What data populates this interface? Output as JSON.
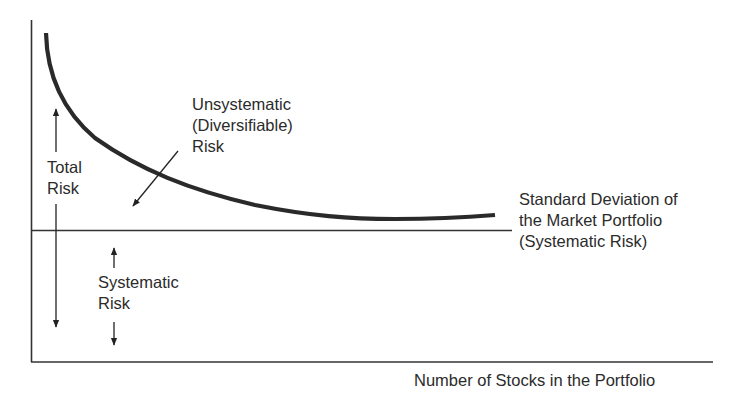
{
  "diagram": {
    "type": "portfolio-diversification-risk",
    "labels": {
      "unsystematic": [
        "Unsystematic",
        "(Diversifiable)",
        "Risk"
      ],
      "total": [
        "Total",
        "Risk"
      ],
      "market_sd": [
        "Standard Deviation of",
        "the Market Portfolio",
        "(Systematic Risk)"
      ],
      "systematic": [
        "Systematic",
        "Risk"
      ],
      "x_axis": "Number of Stocks in the Portfolio"
    },
    "colors": {
      "curve": "#2a2a2a",
      "axis": "#333333",
      "text": "#2b2b2b"
    }
  }
}
